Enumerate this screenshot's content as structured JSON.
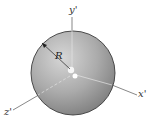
{
  "figure": {
    "type": "sphere-with-axes",
    "colors": {
      "sphere_light": "#d2d2d2",
      "sphere_mid": "#a9a9a9",
      "sphere_dark": "#7f7f7f",
      "outline": "#3a3a3a",
      "axis": "#555555",
      "inner_axis": "#e6e6e6"
    },
    "labels": {
      "y_axis": "y'",
      "x_axis": "x'",
      "z_axis": "z'",
      "radius": "R"
    }
  }
}
